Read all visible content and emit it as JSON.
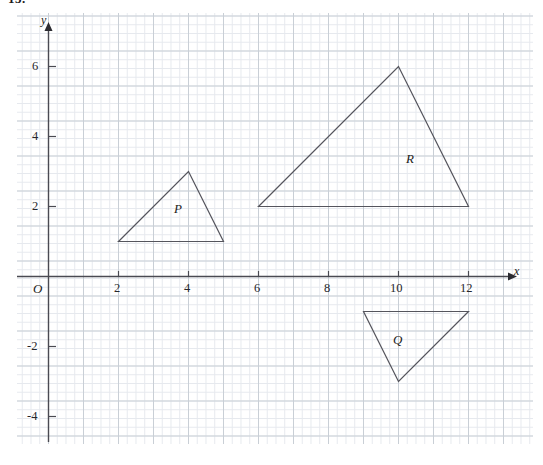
{
  "question_number": "13.",
  "axes": {
    "x_label": "x",
    "y_label": "y",
    "origin_label": "O",
    "x_ticks": [
      {
        "value": 2,
        "label": "2"
      },
      {
        "value": 4,
        "label": "4"
      },
      {
        "value": 6,
        "label": "6"
      },
      {
        "value": 8,
        "label": "8"
      },
      {
        "value": 10,
        "label": "10"
      },
      {
        "value": 12,
        "label": "12"
      }
    ],
    "y_ticks": [
      {
        "value": 6,
        "label": "6"
      },
      {
        "value": 4,
        "label": "4"
      },
      {
        "value": 2,
        "label": "2"
      },
      {
        "value": -2,
        "label": "-2"
      },
      {
        "value": -4,
        "label": "-4"
      }
    ]
  },
  "chart_data": {
    "type": "scatter",
    "title": "",
    "xlabel": "x",
    "ylabel": "y",
    "grid": true,
    "legend": "none",
    "xlim": [
      -1,
      14.2
    ],
    "ylim": [
      -5,
      7.3
    ],
    "xticks": [
      2,
      4,
      6,
      8,
      10,
      12
    ],
    "yticks": [
      -4,
      -2,
      2,
      4,
      6
    ],
    "minor_grid_step": 0.25,
    "major_grid_step": 1,
    "series": [
      {
        "name": "P",
        "type": "polygon",
        "label": "P",
        "label_position": [
          3.7,
          1.9
        ],
        "points": [
          [
            2,
            1
          ],
          [
            5,
            1
          ],
          [
            4,
            3
          ]
        ]
      },
      {
        "name": "Q",
        "type": "polygon",
        "label": "Q",
        "label_position": [
          10.1,
          -1.85
        ],
        "points": [
          [
            9,
            -1
          ],
          [
            12,
            -1
          ],
          [
            10,
            -3
          ]
        ]
      },
      {
        "name": "R",
        "type": "polygon",
        "label": "R",
        "label_position": [
          10.45,
          3.3
        ],
        "points": [
          [
            6,
            2
          ],
          [
            12,
            2
          ],
          [
            10,
            6
          ]
        ]
      }
    ]
  },
  "colors": {
    "minor_grid": "#e6e9ee",
    "major_grid": "#c9cfd6",
    "axis": "#4a4a52",
    "shape_stroke": "#55555d",
    "text": "#1c1c20",
    "background": "#ffffff"
  }
}
